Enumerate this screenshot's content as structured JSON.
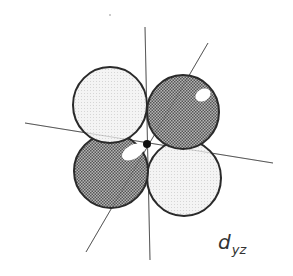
{
  "diagram": {
    "label": {
      "main": "d",
      "subscript": "yz"
    },
    "colors": {
      "outline": "#2a2a2a",
      "axis": "#666666",
      "light_lobe_fill": "#f2f2f2",
      "dark_lobe_fill": "#8a8a8a",
      "highlight": "#ffffff",
      "nucleus": "#111111"
    },
    "axes": [
      {
        "name": "vertical-axis",
        "x1": 145,
        "y1": 27,
        "x2": 150,
        "y2": 260
      },
      {
        "name": "horizontal-axis",
        "x1": 25,
        "y1": 123,
        "x2": 273,
        "y2": 163
      },
      {
        "name": "diagonal-axis",
        "x1": 208,
        "y1": 43,
        "x2": 86,
        "y2": 252
      }
    ],
    "lobes": [
      {
        "name": "lobe-upper-left",
        "shade": "light",
        "cx": 110,
        "cy": 105,
        "rx": 37,
        "ry": 38,
        "highlight": null
      },
      {
        "name": "lobe-upper-right",
        "shade": "dark",
        "cx": 183,
        "cy": 112,
        "rx": 36,
        "ry": 37,
        "highlight": {
          "cx": 203,
          "cy": 95,
          "rx": 8,
          "ry": 6
        }
      },
      {
        "name": "lobe-lower-left",
        "shade": "dark",
        "cx": 111,
        "cy": 171,
        "rx": 37,
        "ry": 37,
        "highlight": {
          "cx": 133,
          "cy": 152,
          "rx": 12,
          "ry": 7
        }
      },
      {
        "name": "lobe-lower-right",
        "shade": "light",
        "cx": 184,
        "cy": 178,
        "rx": 37,
        "ry": 38,
        "highlight": null
      }
    ],
    "nucleus": {
      "cx": 147,
      "cy": 144,
      "r": 4
    },
    "stray_dot": {
      "cx": 110,
      "cy": 15,
      "r": 0.8
    }
  }
}
